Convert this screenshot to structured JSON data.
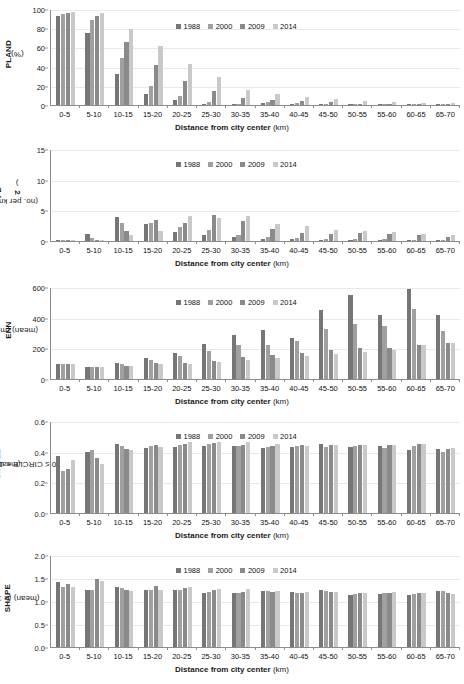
{
  "figure": {
    "xlabel_bold": "Distance from city center",
    "xlabel_unit": "(km)",
    "categories": [
      "0-5",
      "5-10",
      "10-15",
      "15-20",
      "20-25",
      "25-30",
      "30-35",
      "35-40",
      "40-45",
      "45-50",
      "50-55",
      "55-60",
      "60-65",
      "65-70"
    ],
    "legend": [
      {
        "label": "1988",
        "color": "#767676"
      },
      {
        "label": "2000",
        "color": "#a0a0a0"
      },
      {
        "label": "2009",
        "color": "#8a8a8a"
      },
      {
        "label": "2014",
        "color": "#c9c9c9"
      }
    ]
  },
  "chart_data": [
    {
      "type": "bar",
      "id": "pland",
      "title": "",
      "ylabel_main": "PLAND",
      "ylabel_unit": "(%)",
      "xlabel": "Distance from city center (km)",
      "ylim": [
        0,
        100
      ],
      "yticks": [
        0,
        20,
        40,
        60,
        80,
        100
      ],
      "ytick_labels": [
        "0",
        "20",
        "40",
        "60",
        "80",
        "100"
      ],
      "grid": true,
      "legend_position": "top-center",
      "categories": [
        "0-5",
        "5-10",
        "10-15",
        "15-20",
        "20-25",
        "25-30",
        "30-35",
        "35-40",
        "40-45",
        "45-50",
        "50-55",
        "55-60",
        "60-65",
        "65-70"
      ],
      "series": [
        {
          "name": "1988",
          "values": [
            92.5,
            75.5,
            32.5,
            11.0,
            5.0,
            1.5,
            0.8,
            1.8,
            1.5,
            0.7,
            0.2,
            0.2,
            0.2,
            0.2
          ]
        },
        {
          "name": "2000",
          "values": [
            95.0,
            88.5,
            49.0,
            19.5,
            9.5,
            3.0,
            1.5,
            2.8,
            2.0,
            1.2,
            0.5,
            0.5,
            1.0,
            0.5
          ]
        },
        {
          "name": "2009",
          "values": [
            95.5,
            92.5,
            65.5,
            42.0,
            25.0,
            14.5,
            7.0,
            5.5,
            4.0,
            3.5,
            1.5,
            1.5,
            1.5,
            1.0
          ]
        },
        {
          "name": "2014",
          "values": [
            97.0,
            96.0,
            79.5,
            61.0,
            42.5,
            29.0,
            16.0,
            11.5,
            8.0,
            6.5,
            4.0,
            3.0,
            2.5,
            2.0
          ]
        }
      ]
    },
    {
      "type": "bar",
      "id": "pd",
      "ylabel_main": "PD",
      "ylabel_unit": "(no. per km²)",
      "xlabel": "Distance from city center (km)",
      "ylim": [
        0,
        15
      ],
      "yticks": [
        0,
        5,
        10,
        15
      ],
      "ytick_labels": [
        "0",
        "5",
        "10",
        "15"
      ],
      "grid": true,
      "legend_position": "top-center",
      "categories": [
        "0-5",
        "5-10",
        "10-15",
        "15-20",
        "20-25",
        "25-30",
        "30-35",
        "35-40",
        "40-45",
        "45-50",
        "50-55",
        "55-60",
        "60-65",
        "65-70"
      ],
      "series": [
        {
          "name": "1988",
          "values": [
            0.2,
            1.2,
            3.9,
            2.7,
            1.5,
            0.9,
            0.6,
            0.35,
            0.3,
            0.2,
            0.1,
            0.15,
            0.1,
            0.1
          ]
        },
        {
          "name": "2000",
          "values": [
            0.15,
            0.55,
            2.9,
            3.0,
            2.3,
            1.8,
            0.9,
            0.6,
            0.5,
            0.35,
            0.25,
            0.35,
            0.2,
            0.2
          ]
        },
        {
          "name": "2009",
          "values": [
            0.1,
            0.15,
            1.6,
            3.4,
            3.0,
            4.2,
            3.2,
            2.0,
            1.3,
            1.2,
            1.3,
            1.2,
            1.0,
            0.7
          ]
        },
        {
          "name": "2014",
          "values": [
            0.1,
            0.1,
            0.9,
            1.6,
            4.0,
            3.8,
            4.0,
            2.8,
            2.4,
            1.8,
            1.7,
            1.4,
            1.1,
            0.9
          ]
        }
      ]
    },
    {
      "type": "bar",
      "id": "enn",
      "ylabel_main": "ENN",
      "ylabel_unit": "(mean) (m)",
      "xlabel": "Distance from city center (km)",
      "ylim": [
        0,
        600
      ],
      "yticks": [
        0,
        200,
        400,
        600
      ],
      "ytick_labels": [
        "0",
        "200",
        "400",
        "600"
      ],
      "grid": true,
      "legend_position": "top-center",
      "categories": [
        "0-5",
        "5-10",
        "10-15",
        "15-20",
        "20-25",
        "25-30",
        "30-35",
        "35-40",
        "40-45",
        "45-50",
        "50-55",
        "55-60",
        "60-65",
        "65-70"
      ],
      "series": [
        {
          "name": "1988",
          "values": [
            98,
            80,
            103,
            140,
            172,
            228,
            285,
            318,
            265,
            450,
            545,
            418,
            588,
            415
          ]
        },
        {
          "name": "2000",
          "values": [
            96,
            78,
            97,
            122,
            150,
            180,
            220,
            222,
            248,
            325,
            360,
            345,
            458,
            310
          ]
        },
        {
          "name": "2009",
          "values": [
            95,
            76,
            88,
            105,
            105,
            120,
            142,
            158,
            170,
            192,
            205,
            200,
            222,
            232
          ]
        },
        {
          "name": "2014",
          "values": [
            100,
            78,
            85,
            98,
            100,
            110,
            123,
            138,
            152,
            165,
            175,
            190,
            222,
            235
          ]
        }
      ]
    },
    {
      "type": "bar",
      "id": "circle",
      "ylabel_main": "CIRCLE",
      "ylabel_unit": "(mean)",
      "ylabel_line2": "(0 ≤ CIRCLE < 1)",
      "xlabel": "Distance from city center (km)",
      "ylim": [
        0,
        0.6
      ],
      "yticks": [
        0,
        0.2,
        0.4,
        0.6
      ],
      "ytick_labels": [
        "0.0",
        "0.2",
        "0.4",
        "0.6"
      ],
      "grid": true,
      "legend_position": "top-center",
      "categories": [
        "0-5",
        "5-10",
        "10-15",
        "15-20",
        "20-25",
        "25-30",
        "30-35",
        "35-40",
        "40-45",
        "45-50",
        "50-55",
        "55-60",
        "60-65",
        "65-70"
      ],
      "series": [
        {
          "name": "1988",
          "values": [
            0.375,
            0.395,
            0.452,
            0.422,
            0.432,
            0.436,
            0.436,
            0.425,
            0.428,
            0.45,
            0.43,
            0.44,
            0.41,
            0.418
          ]
        },
        {
          "name": "2000",
          "values": [
            0.275,
            0.412,
            0.435,
            0.44,
            0.443,
            0.448,
            0.438,
            0.432,
            0.438,
            0.432,
            0.437,
            0.425,
            0.435,
            0.395
          ]
        },
        {
          "name": "2009",
          "values": [
            0.285,
            0.362,
            0.415,
            0.445,
            0.452,
            0.455,
            0.445,
            0.44,
            0.442,
            0.443,
            0.445,
            0.445,
            0.448,
            0.42
          ]
        },
        {
          "name": "2014",
          "values": [
            0.348,
            0.322,
            0.412,
            0.428,
            0.46,
            0.46,
            0.462,
            0.452,
            0.44,
            0.445,
            0.445,
            0.445,
            0.45,
            0.425
          ]
        }
      ]
    },
    {
      "type": "bar",
      "id": "shape",
      "ylabel_main": "SHAPE",
      "ylabel_unit": "(mean) (≥ 1)",
      "xlabel": "Distance from city center (km)",
      "ylim": [
        0,
        2.0
      ],
      "yticks": [
        0,
        0.5,
        1.0,
        1.5,
        2.0
      ],
      "ytick_labels": [
        "0.0",
        "0.5",
        "1.0",
        "1.5",
        "2.0"
      ],
      "grid": true,
      "legend_position": "top-center",
      "categories": [
        "0-5",
        "5-10",
        "10-15",
        "15-20",
        "20-25",
        "25-30",
        "30-35",
        "35-40",
        "40-45",
        "45-50",
        "50-55",
        "55-60",
        "60-65",
        "65-70"
      ],
      "series": [
        {
          "name": "1988",
          "values": [
            1.41,
            1.25,
            1.31,
            1.23,
            1.23,
            1.18,
            1.17,
            1.21,
            1.19,
            1.24,
            1.12,
            1.16,
            1.12,
            1.22
          ]
        },
        {
          "name": "2000",
          "values": [
            1.31,
            1.25,
            1.28,
            1.24,
            1.24,
            1.2,
            1.18,
            1.21,
            1.18,
            1.21,
            1.15,
            1.17,
            1.15,
            1.21
          ]
        },
        {
          "name": "2009",
          "values": [
            1.37,
            1.48,
            1.25,
            1.32,
            1.29,
            1.23,
            1.2,
            1.19,
            1.18,
            1.2,
            1.17,
            1.18,
            1.18,
            1.17
          ]
        },
        {
          "name": "2014",
          "values": [
            1.31,
            1.44,
            1.22,
            1.24,
            1.3,
            1.27,
            1.26,
            1.22,
            1.19,
            1.2,
            1.18,
            1.19,
            1.18,
            1.15
          ]
        }
      ]
    }
  ]
}
